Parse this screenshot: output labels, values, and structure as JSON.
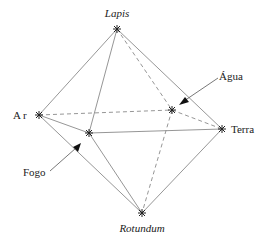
{
  "diagram": {
    "type": "octahedron-elements",
    "vertices": [
      {
        "id": "lapis",
        "label": "Lapis",
        "italic": true,
        "x": 117,
        "y": 29
      },
      {
        "id": "ar",
        "label": "Ar",
        "italic": false,
        "x": 39,
        "y": 115
      },
      {
        "id": "fogo",
        "label": "Fogo",
        "italic": false,
        "x": 89,
        "y": 133
      },
      {
        "id": "agua",
        "label": "Água",
        "italic": false,
        "x": 172,
        "y": 110
      },
      {
        "id": "terra",
        "label": "Terra",
        "italic": false,
        "x": 222,
        "y": 129
      },
      {
        "id": "rotundum",
        "label": "Rotundum",
        "italic": true,
        "x": 142,
        "y": 213
      }
    ],
    "edges": [
      {
        "from": "lapis",
        "to": "ar",
        "style": "solid"
      },
      {
        "from": "lapis",
        "to": "fogo",
        "style": "solid"
      },
      {
        "from": "lapis",
        "to": "terra",
        "style": "solid"
      },
      {
        "from": "lapis",
        "to": "agua",
        "style": "dashed"
      },
      {
        "from": "ar",
        "to": "agua",
        "style": "dashed"
      },
      {
        "from": "ar",
        "to": "fogo",
        "style": "solid"
      },
      {
        "from": "ar",
        "to": "rotundum",
        "style": "solid"
      },
      {
        "from": "fogo",
        "to": "terra",
        "style": "solid"
      },
      {
        "from": "fogo",
        "to": "rotundum",
        "style": "solid"
      },
      {
        "from": "agua",
        "to": "terra",
        "style": "dashed"
      },
      {
        "from": "agua",
        "to": "rotundum",
        "style": "dashed"
      },
      {
        "from": "terra",
        "to": "rotundum",
        "style": "solid"
      }
    ],
    "labels": {
      "lapis": "Lapis",
      "ar": "Ar",
      "fogo": "Fogo",
      "agua": "Água",
      "terra": "Terra",
      "rotundum": "Rotundum"
    },
    "pointers": [
      {
        "label": "Água",
        "target": "agua"
      },
      {
        "label": "Fogo",
        "target": "fogo"
      }
    ]
  }
}
